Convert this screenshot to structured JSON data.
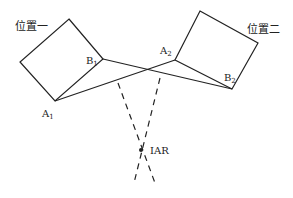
{
  "diagram": {
    "type": "instantaneous-axis-of-rotation",
    "labels": {
      "position1": "位置一",
      "position2": "位置二",
      "A1": {
        "base": "A",
        "sub": "1"
      },
      "B1": {
        "base": "B",
        "sub": "1"
      },
      "A2": {
        "base": "A",
        "sub": "2"
      },
      "B2": {
        "base": "B",
        "sub": "2"
      },
      "iar": "IAR"
    },
    "colors": {
      "line": "#222222",
      "background": "#ffffff"
    }
  }
}
